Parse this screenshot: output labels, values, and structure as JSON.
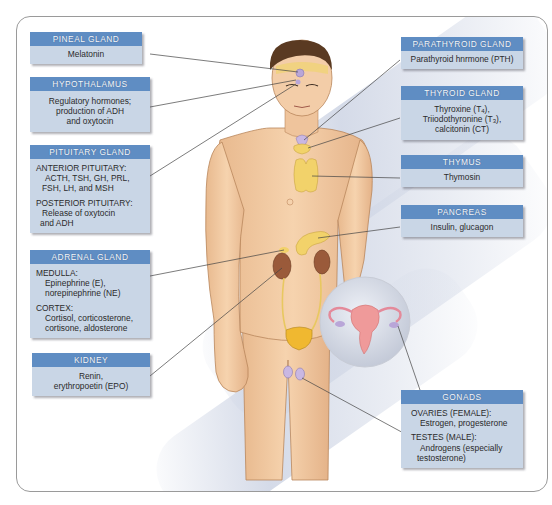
{
  "figure": {
    "colors": {
      "header_bar": "#5f8dc3",
      "box_body": "#c9d6e6",
      "skin": "#f2c9a0",
      "hair": "#5a3a22",
      "gland_yellow": "#f2d26a",
      "gland_purple": "#b9a6d8",
      "kidney": "#9a5a3a",
      "uterus": "#ef9a9a",
      "frame_border": "#9a9a9a"
    }
  },
  "labels": {
    "pineal": {
      "title": "PINEAL GLAND",
      "lines": [
        "Melatonin"
      ]
    },
    "hypothalamus": {
      "title": "HYPOTHALAMUS",
      "lines": [
        "Regulatory hormones;",
        "production of ADH",
        "and oxytocin"
      ]
    },
    "pituitary": {
      "title": "PITUITARY GLAND",
      "sections": [
        {
          "heading": "ANTERIOR PITUITARY:",
          "lines": [
            "ACTH, TSH, GH, PRL,",
            "FSH, LH, and MSH"
          ]
        },
        {
          "heading": "POSTERIOR PITUITARY:",
          "lines": [
            "Release of oxytocin",
            "and ADH"
          ]
        }
      ]
    },
    "adrenal": {
      "title": "ADRENAL GLAND",
      "sections": [
        {
          "heading": "MEDULLA:",
          "lines": [
            "Epinephrine (E),",
            "norepinephrine (NE)"
          ]
        },
        {
          "heading": "CORTEX:",
          "lines": [
            "Cortisol, corticosterone,",
            "cortisone, aldosterone"
          ]
        }
      ]
    },
    "kidney": {
      "title": "KIDNEY",
      "lines": [
        "Renin,",
        "erythropoetin (EPO)"
      ]
    },
    "parathyroid": {
      "title": "PARATHYROID GLAND",
      "lines": [
        "Parathyroid hnrmone (PTH)"
      ]
    },
    "thyroid": {
      "title": "THYROID GLAND",
      "line1_pre": "Thyroxine (T",
      "line1_sub": "4",
      "line1_post": "),",
      "line2_pre": "Triiodothyronine (T",
      "line2_sub": "3",
      "line2_post": "),",
      "line3": "calcitonin (CT)"
    },
    "thymus": {
      "title": "THYMUS",
      "lines": [
        "Thymosin"
      ]
    },
    "pancreas": {
      "title": "PANCREAS",
      "lines": [
        "Insulin, glucagon"
      ]
    },
    "gonads": {
      "title": "GONADS",
      "sections": [
        {
          "heading": "OVARIES (FEMALE):",
          "lines": [
            "Estrogen, progesterone"
          ]
        },
        {
          "heading": "TESTES (MALE):",
          "lines": [
            "Androgens (especially",
            "testosterone)"
          ]
        }
      ]
    }
  }
}
